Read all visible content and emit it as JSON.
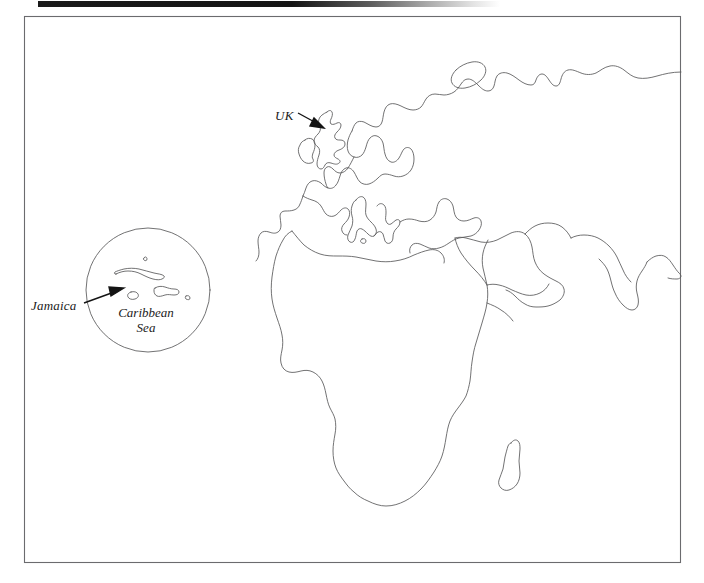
{
  "document": {
    "type": "map",
    "title": "Outline map of Europe, Africa and the Caribbean inset",
    "background_color": "#ffffff",
    "line_color": "#58585a",
    "text_color": "#1b1b1b"
  },
  "artifacts": {
    "top_scan_bar": {
      "name": "scan-edge-bar",
      "color": "#141414",
      "fade_to": "#ffffff"
    }
  },
  "frame": {
    "name": "map-border",
    "color": "#6b6b6e",
    "left": 24,
    "top": 16,
    "right": 681,
    "bottom": 563
  },
  "labels": [
    {
      "id": "uk",
      "text": "UK",
      "style": "italic"
    },
    {
      "id": "jamaica",
      "text": "Jamaica",
      "style": "italic"
    },
    {
      "id": "caribbean",
      "line1": "Caribbean",
      "line2": "Sea",
      "style": "italic"
    }
  ],
  "annotations": {
    "uk_label": "UK",
    "jamaica_label": "Jamaica",
    "caribbean_sea_label_line1": "Caribbean",
    "caribbean_sea_label_line2": "Sea"
  },
  "features": {
    "landmasses": [
      "Great Britain",
      "Ireland",
      "Scandinavia",
      "Iceland",
      "Northern Eurasia coastline",
      "Iberian Peninsula",
      "Italy",
      "Balkans and Greece",
      "Turkey and Black Sea",
      "Africa",
      "Arabian Peninsula",
      "Madagascar",
      "Indian subcontinent"
    ],
    "inset": {
      "name": "caribbean-inset",
      "shape": "circle",
      "center_x": 148,
      "center_y": 290,
      "radius": 62,
      "islands": [
        "Cuba",
        "Jamaica",
        "Hispaniola",
        "Puerto Rico",
        "Bahamas"
      ]
    },
    "pointers": [
      {
        "name": "uk-arrow",
        "from_label": "UK",
        "to_feature": "Great Britain"
      },
      {
        "name": "jamaica-arrow",
        "from_label": "Jamaica",
        "to_feature": "Jamaica"
      }
    ]
  }
}
